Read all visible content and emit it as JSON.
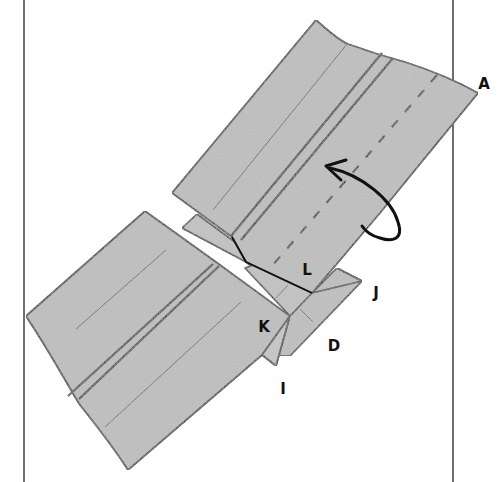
{
  "figure": {
    "type": "origami-folding-diagram",
    "colors": {
      "paper": "#b9b9b9",
      "paper_shade": "#a8a8a8",
      "outline": "#111111",
      "frame": "#6e6e6e",
      "background": "#ffffff"
    },
    "frame_lines": [
      {
        "x": 24,
        "y1": 0,
        "y2": 482
      },
      {
        "x": 453,
        "y1": 0,
        "y2": 482
      }
    ],
    "instruction_arrow": {
      "kind": "flip-over",
      "direction": "counter-clockwise back-fold"
    },
    "dashed_fold_line": "valley fold through upper strip"
  },
  "labels": [
    {
      "id": "A",
      "text": "A",
      "x": 484,
      "y": 84
    },
    {
      "id": "J",
      "text": "J",
      "x": 376,
      "y": 293
    },
    {
      "id": "L",
      "text": "L",
      "x": 307,
      "y": 270
    },
    {
      "id": "K",
      "text": "K",
      "x": 264,
      "y": 327
    },
    {
      "id": "D",
      "text": "D",
      "x": 334,
      "y": 346
    },
    {
      "id": "I",
      "text": "I",
      "x": 283,
      "y": 389
    }
  ]
}
